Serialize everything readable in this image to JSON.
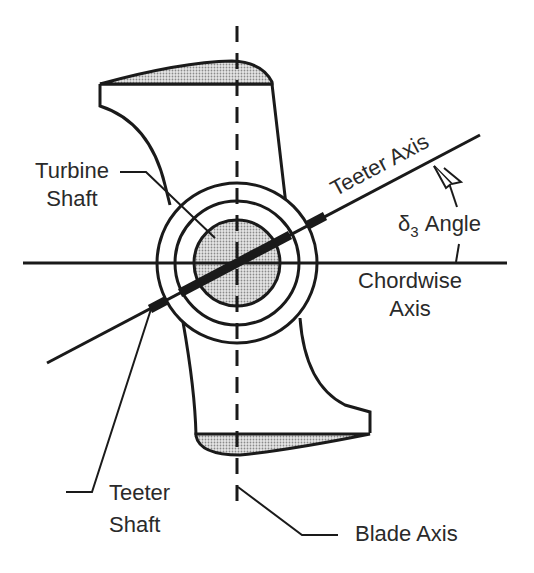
{
  "figure": {
    "type": "engineering diagram"
  },
  "labels": {
    "turbine_shaft_line1": "Turbine",
    "turbine_shaft_line2": "Shaft",
    "teeter_axis": "Teeter Axis",
    "delta3_symbol": "δ",
    "delta3_subscript": "3",
    "delta3_text": "Angle",
    "chordwise_line1": "Chordwise",
    "chordwise_line2": "Axis",
    "teeter_shaft_line1": "Teeter",
    "teeter_shaft_line2": "Shaft",
    "blade_axis": "Blade Axis"
  },
  "colors": {
    "line": "#1a1a1a",
    "text": "#2a2a2a",
    "shading": "#b8b8b8",
    "background": "#ffffff"
  }
}
